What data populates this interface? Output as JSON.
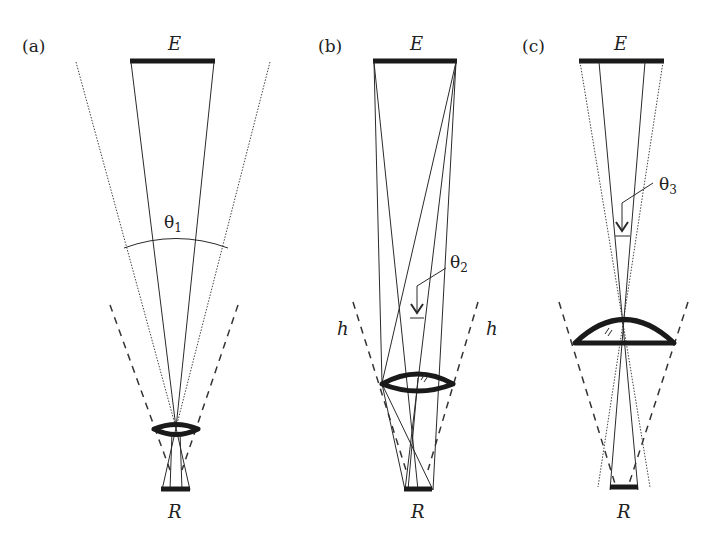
{
  "figure": {
    "panels": [
      {
        "id": "a",
        "label": "(a)",
        "emitter_label": "E",
        "receiver_label": "R",
        "angle_symbol": "θ",
        "angle_subscript": "1"
      },
      {
        "id": "b",
        "label": "(b)",
        "emitter_label": "E",
        "receiver_label": "R",
        "angle_symbol": "θ",
        "angle_subscript": "2",
        "h_left": "h",
        "h_right": "h"
      },
      {
        "id": "c",
        "label": "(c)",
        "emitter_label": "E",
        "receiver_label": "R",
        "angle_symbol": "θ",
        "angle_subscript": "3"
      }
    ],
    "colors": {
      "line": "#2a2a2a",
      "background": "#ffffff"
    }
  }
}
